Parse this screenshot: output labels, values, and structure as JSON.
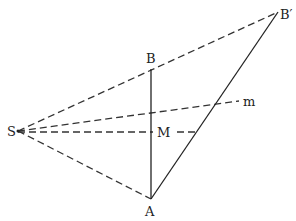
{
  "diagram": {
    "points": {
      "S": {
        "label": "S",
        "x": 18,
        "y": 131
      },
      "B": {
        "label": "B",
        "x": 151,
        "y": 69
      },
      "A": {
        "label": "A",
        "x": 151,
        "y": 199
      },
      "B_prime": {
        "label": "B′",
        "x": 278,
        "y": 12
      },
      "m": {
        "label": "m",
        "x": 239,
        "y": 101
      },
      "M": {
        "label": "M",
        "x": 165,
        "y": 132
      }
    },
    "segments": {
      "solid": [
        "A-B",
        "A-B′"
      ],
      "dashed": [
        "S-B′",
        "S-m",
        "S-M (horizontal to A-B′)",
        "S-A"
      ]
    },
    "colors": {
      "line": "#222222",
      "background": "#ffffff"
    }
  }
}
